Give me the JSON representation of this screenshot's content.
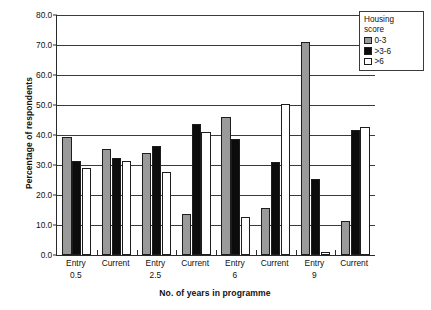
{
  "chart_data": {
    "type": "bar",
    "title": "",
    "xlabel": "No. of years in programme",
    "ylabel": "Percentage of respondents",
    "ylim": [
      0,
      80
    ],
    "yticks": [
      "0.0",
      "10.0",
      "20.0",
      "30.0",
      "40.0",
      "50.0",
      "60.0",
      "70.0",
      "80.0"
    ],
    "ytick_values": [
      0,
      10,
      20,
      30,
      40,
      50,
      60,
      70,
      80
    ],
    "grid": true,
    "legend_position": "top-right",
    "legend_title": "Housing score",
    "legend_title_line1": "Housing",
    "legend_title_line2": "score",
    "categories": [
      {
        "line1": "Entry",
        "line2": "0.5"
      },
      {
        "line1": "Current",
        "line2": ""
      },
      {
        "line1": "Entry",
        "line2": "2.5"
      },
      {
        "line1": "Current",
        "line2": ""
      },
      {
        "line1": "Entry",
        "line2": "6"
      },
      {
        "line1": "Current",
        "line2": ""
      },
      {
        "line1": "Entry",
        "line2": "9"
      },
      {
        "line1": "Current",
        "line2": ""
      }
    ],
    "series": [
      {
        "name": "0-3",
        "color": "#9a9a9a",
        "values": [
          39.2,
          35.5,
          34.0,
          13.8,
          46.0,
          15.8,
          71.0,
          11.2
        ]
      },
      {
        "name": ">3-6",
        "color": "#0c0c0c",
        "values": [
          31.2,
          32.2,
          36.2,
          43.8,
          38.8,
          30.9,
          25.3,
          41.8
        ]
      },
      {
        "name": ">6",
        "color": "#ffffff",
        "values": [
          29.0,
          31.2,
          27.8,
          41.0,
          12.6,
          50.2,
          0.9,
          42.8
        ]
      }
    ]
  }
}
